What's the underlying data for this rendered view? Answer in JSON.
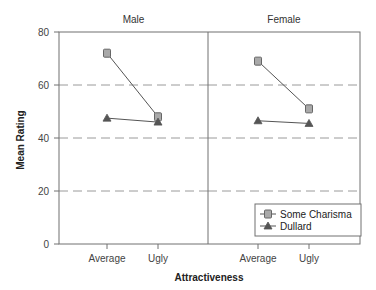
{
  "chart_data": {
    "type": "line",
    "title": "",
    "xlabel": "Attractiveness",
    "ylabel": "Mean Rating",
    "ylim": [
      0,
      80
    ],
    "yticks": [
      0,
      20,
      40,
      60,
      80
    ],
    "gridlines": {
      "y": [
        20,
        40,
        60
      ],
      "style": "dashed"
    },
    "categories": [
      "Average",
      "Ugly"
    ],
    "panels": [
      {
        "title": "Male",
        "series": [
          {
            "name": "Some Charisma",
            "marker": "square",
            "values": [
              72,
              48
            ]
          },
          {
            "name": "Dullard",
            "marker": "triangle",
            "values": [
              47.5,
              46
            ]
          }
        ]
      },
      {
        "title": "Female",
        "series": [
          {
            "name": "Some Charisma",
            "marker": "square",
            "values": [
              69,
              51
            ]
          },
          {
            "name": "Dullard",
            "marker": "triangle",
            "values": [
              46.5,
              45.5
            ]
          }
        ]
      }
    ],
    "legend": {
      "position": "lower-right",
      "entries": [
        {
          "label": "Some Charisma",
          "marker": "square"
        },
        {
          "label": "Dullard",
          "marker": "triangle"
        }
      ]
    }
  },
  "colors": {
    "frame": "#707070",
    "grid": "#9a9a9a",
    "line": "#555555",
    "square_fill": "#a9a9a9",
    "square_stroke": "#666666",
    "triangle_fill": "#555555"
  }
}
